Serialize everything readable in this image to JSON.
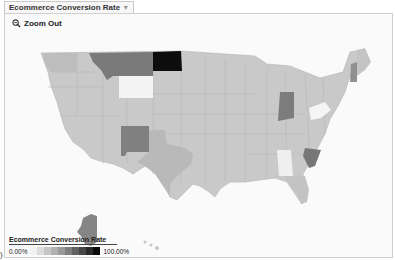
{
  "tab": {
    "label": "Ecommerce Conversion Rate",
    "arrow": "▼"
  },
  "toolbar": {
    "zoom_out_label": "Zoom Out"
  },
  "legend": {
    "title": "Ecommerce Conversion Rate",
    "min_label": "0.00%",
    "max_label": "100.00%",
    "gradient": [
      "#f2f2f2",
      "#dcdcdc",
      "#c6c6c6",
      "#b0b0b0",
      "#9a9a9a",
      "#7e7e7e",
      "#626262",
      "#464646",
      "#2a2a2a",
      "#0a0a0a"
    ]
  },
  "map": {
    "region": "United States",
    "land_color": "#c8c8c8",
    "background": "#fafafa",
    "highlights": {
      "North Dakota": "#0d0d0d",
      "Montana": "#7a7a7a",
      "Wyoming": "#f4f4f4",
      "Indiana": "#7c7c7c",
      "New Mexico": "#808080",
      "South Carolina": "#777777",
      "Alaska": "#858585",
      "New Hampshire": "#909090",
      "West Virginia": "#f5f5f5",
      "Alabama": "#efefef"
    }
  },
  "corner_mark": ")"
}
